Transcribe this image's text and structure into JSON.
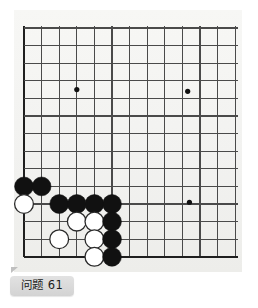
{
  "page": {
    "background_color": "#ffffff",
    "paper_color": "#f3f3f1"
  },
  "label": {
    "text": "问题 61",
    "problem_number": "61",
    "prefix": "问题",
    "background_color": "#d8d8d8",
    "text_color": "#1b1b1b"
  },
  "board": {
    "name": "go-board",
    "description": "Go board corner diagram, lower-left corner",
    "origin_x": 24,
    "origin_y": 28,
    "cell": 17.6,
    "cols": 13,
    "rows": 14,
    "line_color": "#4a4a4a",
    "edge_color": "#1f1f1f",
    "line_width": 1.1,
    "edge_width": 2.2,
    "star_point_color": "#111111",
    "star_point_radius": 2.6,
    "star_points": [
      {
        "col": 3,
        "row": 3.5
      },
      {
        "col": 9.3,
        "row": 3.6
      },
      {
        "col": 9.4,
        "row": 9.9
      }
    ],
    "stone_radius": 9.4,
    "black_color": "#111111",
    "white_color": "#ffffff",
    "white_outline": "#2a2a2a",
    "stones": [
      {
        "color": "black",
        "col": 0,
        "row": 9
      },
      {
        "color": "black",
        "col": 1,
        "row": 9
      },
      {
        "color": "white",
        "col": 0,
        "row": 10
      },
      {
        "color": "black",
        "col": 2,
        "row": 10
      },
      {
        "color": "black",
        "col": 3,
        "row": 10
      },
      {
        "color": "black",
        "col": 4,
        "row": 10
      },
      {
        "color": "black",
        "col": 5,
        "row": 10
      },
      {
        "color": "white",
        "col": 3,
        "row": 11
      },
      {
        "color": "white",
        "col": 4,
        "row": 11
      },
      {
        "color": "black",
        "col": 5,
        "row": 11
      },
      {
        "color": "white",
        "col": 2,
        "row": 12
      },
      {
        "color": "white",
        "col": 4,
        "row": 12
      },
      {
        "color": "black",
        "col": 5,
        "row": 12
      },
      {
        "color": "white",
        "col": 4,
        "row": 13
      },
      {
        "color": "black",
        "col": 5,
        "row": 13
      }
    ],
    "stone_counts": {
      "black": 9,
      "white": 6,
      "total": 15
    }
  }
}
